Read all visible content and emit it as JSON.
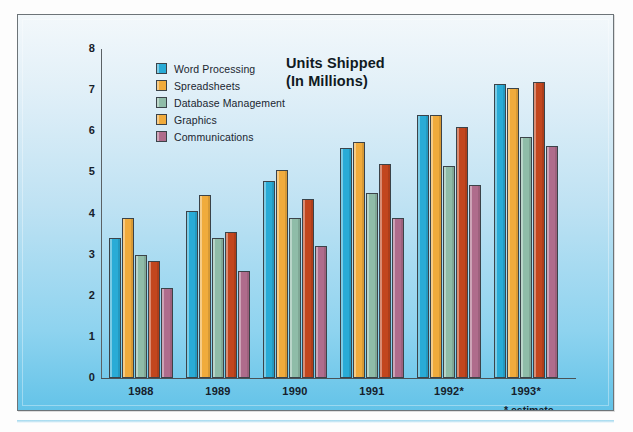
{
  "chart_data": {
    "type": "bar",
    "title": "Units Shipped",
    "subtitle": "(In Millions)",
    "xlabel": "",
    "ylabel": "",
    "ylim": [
      0,
      8
    ],
    "yticks": [
      8,
      7,
      6,
      5,
      4,
      3,
      2,
      1,
      0
    ],
    "grid": false,
    "legend_position": "top-left",
    "categories": [
      "1988",
      "1989",
      "1990",
      "1991",
      "1992*",
      "1993*"
    ],
    "footnote": "* estimate",
    "series": [
      {
        "name": "Word Processing",
        "color": "#29ABD6",
        "values": [
          3.4,
          4.05,
          4.8,
          5.6,
          6.4,
          7.15
        ]
      },
      {
        "name": "Spreadsheets",
        "color": "#F0AB3C",
        "values": [
          3.9,
          4.45,
          5.05,
          5.75,
          6.4,
          7.05
        ]
      },
      {
        "name": "Database Management",
        "color": "#8FBCA8",
        "values": [
          3.0,
          3.4,
          3.9,
          4.5,
          5.15,
          5.85
        ]
      },
      {
        "name": "Graphics",
        "color": "#C2461E",
        "values": [
          2.85,
          3.55,
          4.35,
          5.2,
          6.1,
          7.2
        ]
      },
      {
        "name": "Communications",
        "color": "#AF6C8C",
        "values": [
          2.2,
          2.6,
          3.2,
          3.9,
          4.7,
          5.65
        ]
      }
    ],
    "legend_swatch_colors": [
      "#29ABD6",
      "#F0AB3C",
      "#8FBCA8",
      "#F0AB3C",
      "#AF6C8C"
    ]
  }
}
